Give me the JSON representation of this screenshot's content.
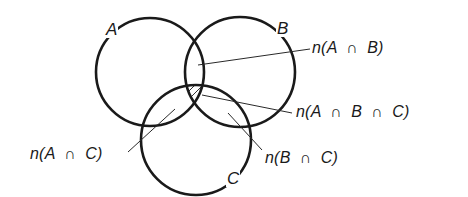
{
  "diagram": {
    "type": "venn",
    "sets": [
      {
        "id": "A",
        "label": "A",
        "cx": 150,
        "cy": 72,
        "r": 54
      },
      {
        "id": "B",
        "label": "B",
        "cx": 240,
        "cy": 72,
        "r": 55
      },
      {
        "id": "C",
        "label": "C",
        "cx": 196,
        "cy": 140,
        "r": 55
      }
    ],
    "labels": {
      "a": "A",
      "b": "B",
      "c": "C"
    },
    "regions": {
      "ab": "n(A  ∩  B)",
      "abc": "n(A  ∩  B  ∩  C)",
      "ac": "n(A  ∩  C)",
      "bc": "n(B  ∩  C)"
    },
    "shaded_region": "A ∩ B ∩ C (hatched)",
    "colors": {
      "stroke": "#1a1a1a",
      "background": "#ffffff"
    }
  }
}
